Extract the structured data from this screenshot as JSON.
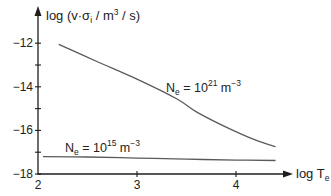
{
  "chart_data": {
    "type": "line",
    "title": "",
    "xlabel": "log T",
    "xlabel_subscript": "e",
    "ylabel": "log (v·σ",
    "ylabel_subscript": "i",
    "ylabel_unit": " / m",
    "ylabel_unit_sup": "3",
    "ylabel_tail": " / s)",
    "xlim": [
      2,
      4.6
    ],
    "ylim": [
      -18,
      -11.5
    ],
    "x_ticks": [
      2,
      3,
      4
    ],
    "x_tick_labels": [
      "2",
      "3",
      "4"
    ],
    "y_ticks": [
      -12,
      -13,
      -14,
      -15,
      -16,
      -17,
      -18
    ],
    "y_tick_labels": [
      "−12",
      "",
      "−14",
      "",
      "−16",
      "",
      "−18"
    ],
    "grid": false,
    "legend": "none (inline annotations)",
    "series": [
      {
        "name": "N_e = 10^21 m^-3",
        "label_main": "N",
        "label_sub": "e",
        "label_eq": " = 10",
        "label_exp": "21",
        "label_unit": " m",
        "label_unit_exp": "−3",
        "x": [
          2.21,
          2.6,
          3.0,
          3.4,
          3.6,
          3.9,
          4.2,
          4.4
        ],
        "y": [
          -12.05,
          -12.85,
          -13.65,
          -14.55,
          -15.15,
          -15.85,
          -16.45,
          -16.75
        ]
      },
      {
        "name": "N_e = 10^15 m^-3",
        "label_main": "N",
        "label_sub": "e",
        "label_eq": " = 10",
        "label_exp": "15",
        "label_unit": " m",
        "label_unit_exp": "−3",
        "x": [
          2.05,
          2.5,
          3.0,
          3.5,
          4.0,
          4.4
        ],
        "y": [
          -17.2,
          -17.22,
          -17.27,
          -17.32,
          -17.36,
          -17.38
        ]
      }
    ]
  }
}
